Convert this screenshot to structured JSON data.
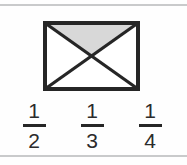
{
  "page": {
    "background_color": "#fefefe",
    "rule_color": "#c9cacb",
    "width": 187,
    "height": 165
  },
  "figure": {
    "name": "rectangle-with-two-diagonals",
    "shape": "rectangle",
    "outline_color": "#262626",
    "outline_width": 4,
    "fill_color": "#ffffff",
    "shaded_fill_color": "#d8d8d8",
    "regions_total": 4,
    "regions_shaded": 1,
    "shaded_region": "top-triangle",
    "diagonals": 2,
    "rect": {
      "x": 43,
      "y": 21,
      "width": 97,
      "height": 70
    }
  },
  "answers": {
    "options": [
      {
        "id": "option-a",
        "numerator": "1",
        "denominator": "2",
        "value": "1/2"
      },
      {
        "id": "option-b",
        "numerator": "1",
        "denominator": "3",
        "value": "1/3"
      },
      {
        "id": "option-c",
        "numerator": "1",
        "denominator": "4",
        "value": "1/4"
      }
    ]
  }
}
